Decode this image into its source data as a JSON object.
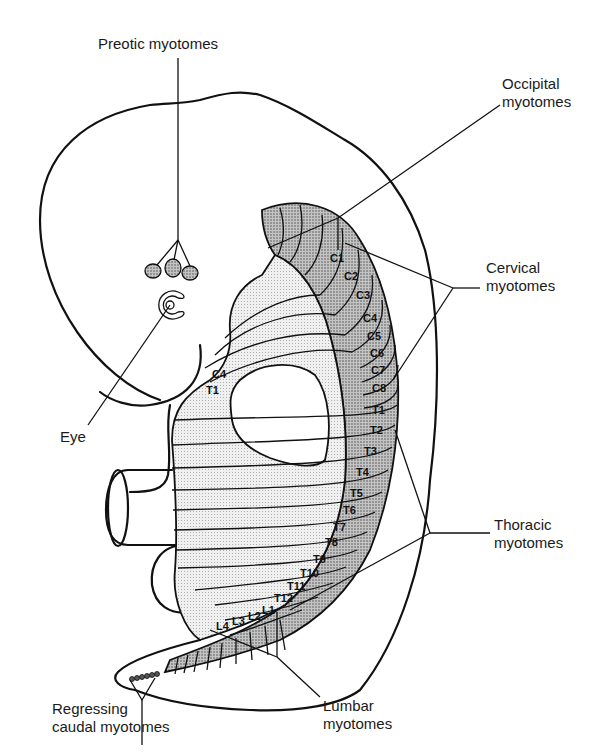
{
  "figure": {
    "labels": {
      "preotic": "Preotic myotomes",
      "occipital_line1": "Occipital",
      "occipital_line2": "myotomes",
      "cervical_line1": "Cervical",
      "cervical_line2": "myotomes",
      "eye": "Eye",
      "thoracic_line1": "Thoracic",
      "thoracic_line2": "myotomes",
      "regressing_line1": "Regressing",
      "regressing_line2": "caudal myotomes",
      "lumbar_line1": "Lumbar",
      "lumbar_line2": "myotomes"
    },
    "segments": {
      "cervical": [
        "C1",
        "C2",
        "C3",
        "C4",
        "C5",
        "C6",
        "C7",
        "C8"
      ],
      "thoracic": [
        "T1",
        "T2",
        "T3",
        "T4",
        "T5",
        "T6",
        "T7",
        "T8",
        "T9",
        "T10",
        "T11",
        "T12"
      ],
      "lumbar": [
        "L1",
        "L2",
        "L3",
        "L4"
      ],
      "limb_bud_labels": [
        "C4",
        "T1"
      ]
    },
    "colors": {
      "ink": "#111111",
      "dark_stipple": "#a8a8a8",
      "light_stipple": "#dcdcdc",
      "background": "#ffffff"
    }
  }
}
